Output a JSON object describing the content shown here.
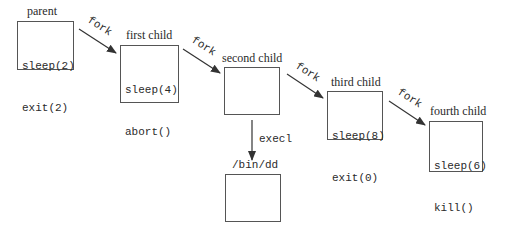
{
  "diagram": {
    "nodes": [
      {
        "id": "parent",
        "title": "parent",
        "code": [
          "sleep(2)",
          "exit(2)"
        ]
      },
      {
        "id": "first",
        "title": "first child",
        "code": [
          "sleep(4)",
          "abort()"
        ]
      },
      {
        "id": "second",
        "title": "second child",
        "code": []
      },
      {
        "id": "third",
        "title": "third child",
        "code": [
          "sleep(8)",
          "exit(0)"
        ]
      },
      {
        "id": "fourth",
        "title": "fourth child",
        "code": [
          "sleep(6)",
          "kill()"
        ]
      },
      {
        "id": "bindd",
        "title": "/bin/dd",
        "code": []
      }
    ],
    "edges": [
      {
        "from": "parent",
        "to": "first",
        "label": "fork"
      },
      {
        "from": "first",
        "to": "second",
        "label": "fork"
      },
      {
        "from": "second",
        "to": "third",
        "label": "fork"
      },
      {
        "from": "third",
        "to": "fourth",
        "label": "fork"
      },
      {
        "from": "second",
        "to": "bindd",
        "label": "execl"
      }
    ],
    "colors": {
      "stroke": "#555555",
      "text": "#2a2a2a",
      "background": "#ffffff"
    }
  }
}
